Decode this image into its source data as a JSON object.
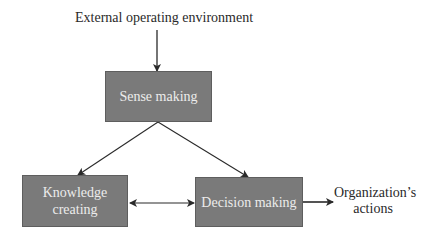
{
  "diagram": {
    "input_label": "External operating environment",
    "nodes": {
      "sense_making": "Sense making",
      "knowledge_creating_line1": "Knowledge",
      "knowledge_creating_line2": "creating",
      "decision_making": "Decision making"
    },
    "output_label_line1": "Organization’s",
    "output_label_line2": "actions",
    "edges": [
      {
        "from": "External operating environment",
        "to": "Sense making",
        "type": "arrow"
      },
      {
        "from": "Sense making",
        "to": "Knowledge creating",
        "type": "arrow"
      },
      {
        "from": "Sense making",
        "to": "Decision making",
        "type": "arrow"
      },
      {
        "from": "Knowledge creating",
        "to": "Decision making",
        "type": "bidirectional"
      },
      {
        "from": "Decision making",
        "to": "Organization's actions",
        "type": "arrow"
      }
    ],
    "colors": {
      "box_fill": "#7a7a7a",
      "box_text": "#ececec",
      "line": "#2a2a2a"
    }
  }
}
